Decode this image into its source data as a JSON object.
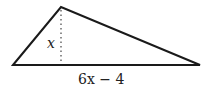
{
  "diagram": {
    "shape": "triangle",
    "height_label": "x",
    "base_label": "6x − 4",
    "vertices": {
      "left": [
        13,
        65
      ],
      "apex": [
        61,
        7
      ],
      "right": [
        200,
        65
      ]
    },
    "altitude": {
      "x": 61,
      "y_top": 9,
      "y_bottom": 62,
      "style": "dotted"
    },
    "colors": {
      "stroke": "#1a1a1a",
      "background": "#ffffff"
    }
  }
}
